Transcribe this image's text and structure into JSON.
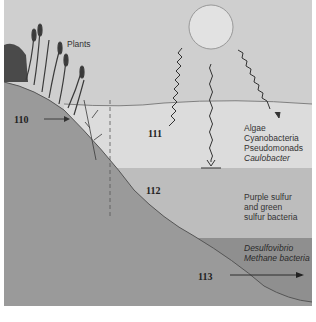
{
  "diagram": {
    "colors": {
      "sky": "#cfcfcf",
      "water_upper": "#dcdcdc",
      "water_middle": "#bdbdbd",
      "water_bottom": "#8f8f8f",
      "ground": "#9a9a9a",
      "sun": "#e2e2e2",
      "line": "#555555"
    },
    "labels": {
      "plants": "Plants",
      "zone_110": "110",
      "zone_111": "111",
      "zone_112": "112",
      "zone_113": "113"
    },
    "zones": [
      {
        "id": "111",
        "organisms": [
          "Algae",
          "Cyanobacteria",
          "Pseudomonads",
          "Caulobacter"
        ],
        "italic": [
          false,
          false,
          false,
          true
        ]
      },
      {
        "id": "112",
        "organisms": [
          "Purple sulfur",
          "and green",
          "sulfur bacteria"
        ],
        "italic": [
          false,
          false,
          false
        ]
      },
      {
        "id": "113",
        "organisms": [
          "Desulfovibrio",
          "Methane bacteria"
        ],
        "italic": [
          true,
          true
        ]
      }
    ],
    "icons": [
      "sun-icon",
      "light-ray-icon",
      "plants-icon",
      "arrow-icon"
    ]
  }
}
